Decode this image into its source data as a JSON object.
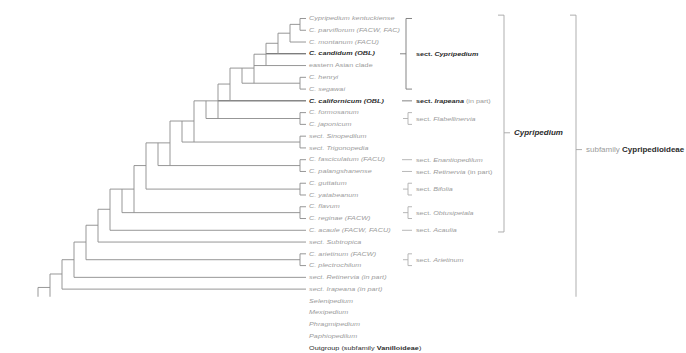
{
  "figure": {
    "colors": {
      "grey_text": "#9b9b9b",
      "dark_text": "#2b2b2b",
      "branch_grey": "#8e8e8e",
      "branch_dark": "#3a3a3a",
      "bracket_grey": "#b0b0b0",
      "background": "#ffffff"
    }
  },
  "tips": [
    {
      "id": "kentuckiense",
      "label": "Cypripedium kentuckiense",
      "style": "grey-italic",
      "y": 22,
      "x": 302
    },
    {
      "id": "parviflorum",
      "label": "C. parviflorum (FACW, FAC)",
      "style": "grey-italic-paren",
      "y": 36,
      "x": 302
    },
    {
      "id": "montanum",
      "label": "C. montanum (FACU)",
      "style": "grey-italic-paren",
      "y": 50,
      "x": 289
    },
    {
      "id": "candidum",
      "label": "C. candidum (OBL)",
      "style": "dark-bold-italic-paren",
      "y": 64,
      "x": 289
    },
    {
      "id": "easternasian",
      "label": "eastern Asian clade",
      "style": "grey-plain",
      "y": 78,
      "x": 289
    },
    {
      "id": "henryi",
      "label": "C. henryi",
      "style": "grey-italic",
      "y": 92,
      "x": 302
    },
    {
      "id": "segawai",
      "label": "C. segawai",
      "style": "grey-italic",
      "y": 106,
      "x": 302
    },
    {
      "id": "californicum",
      "label": "C. californicum (OBL)",
      "style": "dark-bold-italic-paren",
      "y": 120,
      "x": 289
    },
    {
      "id": "formosanum",
      "label": "C. formosanum",
      "style": "grey-italic",
      "y": 134,
      "x": 302
    },
    {
      "id": "japonicum",
      "label": "C. japonicum",
      "style": "grey-italic",
      "y": 148,
      "x": 302
    },
    {
      "id": "sinopedilum",
      "label": "sect. Sinopedilum",
      "style": "grey-sect",
      "y": 162,
      "x": 289
    },
    {
      "id": "trigonopedia",
      "label": "sect. Trigonopedia",
      "style": "grey-sect",
      "y": 176,
      "x": 289
    },
    {
      "id": "fasciculatum",
      "label": "C. fasciculatum (FACU)",
      "style": "grey-italic-paren",
      "y": 190,
      "x": 302
    },
    {
      "id": "palangshanense",
      "label": "C. palangshanense",
      "style": "grey-italic",
      "y": 204,
      "x": 302
    },
    {
      "id": "guttatum",
      "label": "C. guttatum",
      "style": "grey-italic",
      "y": 218,
      "x": 302
    },
    {
      "id": "yatabeanum",
      "label": "C. yatabeanum",
      "style": "grey-italic",
      "y": 232,
      "x": 302
    },
    {
      "id": "flavum",
      "label": "C. flavum",
      "style": "grey-italic",
      "y": 246,
      "x": 302
    },
    {
      "id": "reginae",
      "label": "C. reginae (FACW)",
      "style": "grey-italic-paren",
      "y": 260,
      "x": 302
    },
    {
      "id": "acaule",
      "label": "C. acaule (FACW, FACU)",
      "style": "grey-italic-paren",
      "y": 274,
      "x": 289
    },
    {
      "id": "subtropica",
      "label": "sect. Subtropica",
      "style": "grey-sect",
      "y": 288,
      "x": 289
    },
    {
      "id": "arietinum",
      "label": "C. arietinum (FACW)",
      "style": "grey-italic-paren",
      "y": 302,
      "x": 302
    },
    {
      "id": "plectrochilum",
      "label": "C. plectrochilum",
      "style": "grey-italic",
      "y": 316,
      "x": 302
    },
    {
      "id": "retinervia",
      "label": "sect. Retinervia (in part)",
      "style": "grey-sect-paren",
      "y": 330,
      "x": 289
    },
    {
      "id": "irapeana",
      "label": "sect. Irapeana (in part)",
      "style": "grey-sect-paren",
      "y": 344,
      "x": 289
    },
    {
      "id": "selenipedium",
      "label": "Selenipedium",
      "style": "grey-italic",
      "y": 358,
      "x": 289
    },
    {
      "id": "mexipedium",
      "label": "Mexipedium",
      "style": "grey-italic",
      "y": 372,
      "x": 302
    },
    {
      "id": "phragmipedium",
      "label": "Phragmipedium",
      "style": "grey-italic",
      "y": 386,
      "x": 302
    },
    {
      "id": "paphiopedilum",
      "label": "Paphiopedilum",
      "style": "grey-italic",
      "y": 400,
      "x": 289
    },
    {
      "id": "outgroup",
      "label": "Outgroup (subfamily Vanilloideae)",
      "style": "dark-outgroup",
      "y": 414,
      "x": 289
    }
  ],
  "sections": [
    {
      "id": "sect-cypripedium",
      "label": "sect. Cypripedium",
      "emphasis": "dark-bold",
      "bracket": "tall",
      "top": 22,
      "bottom": 106,
      "mid": 64,
      "x": 420
    },
    {
      "id": "sect-irapeana",
      "label": "sect. Irapeana (in part)",
      "emphasis": "dark-bold",
      "bracket": "dash",
      "top": 120,
      "bottom": 120,
      "mid": 120,
      "x": 420
    },
    {
      "id": "sect-flabellinervia",
      "label": "sect. Flabellinervia",
      "emphasis": "grey",
      "bracket": "small",
      "top": 134,
      "bottom": 148,
      "mid": 141,
      "x": 420
    },
    {
      "id": "sect-enantiopedilum",
      "label": "sect. Enantiopedilum",
      "emphasis": "grey",
      "bracket": "dash",
      "top": 190,
      "bottom": 190,
      "mid": 190,
      "x": 420
    },
    {
      "id": "sect-retinervia",
      "label": "sect. Retinervia (in part)",
      "emphasis": "grey",
      "bracket": "dash",
      "top": 204,
      "bottom": 204,
      "mid": 204,
      "x": 420
    },
    {
      "id": "sect-bifolia",
      "label": "sect. Bifolia",
      "emphasis": "grey",
      "bracket": "small",
      "top": 218,
      "bottom": 232,
      "mid": 225,
      "x": 420
    },
    {
      "id": "sect-obtusipetala",
      "label": "sect. Obtusipetala",
      "emphasis": "grey",
      "bracket": "small",
      "top": 246,
      "bottom": 260,
      "mid": 253,
      "x": 420
    },
    {
      "id": "sect-acaulia",
      "label": "sect. Acaulia",
      "emphasis": "grey",
      "bracket": "dash",
      "top": 274,
      "bottom": 274,
      "mid": 274,
      "x": 420
    },
    {
      "id": "sect-arietinum",
      "label": "sect. Arietinum",
      "emphasis": "grey",
      "bracket": "small",
      "top": 302,
      "bottom": 316,
      "mid": 309,
      "x": 420
    }
  ],
  "clades": [
    {
      "id": "genus-cypripedium",
      "label": "Cypripedium",
      "style": "grey-italic",
      "bracket_x": 504,
      "top": 18,
      "bottom": 276,
      "mid": 158,
      "label_x": 512
    },
    {
      "id": "subfamily-cypripedioideae",
      "label_prefix": "subfamily ",
      "label": "Cypripedioideae",
      "style": "grey-plain-bold",
      "bracket_x": 576,
      "top": 18,
      "bottom": 404,
      "mid": 178,
      "label_x": 584
    }
  ],
  "notes": {
    "wetland_codes": [
      "OBL",
      "FACW",
      "FAC",
      "FACU"
    ]
  }
}
